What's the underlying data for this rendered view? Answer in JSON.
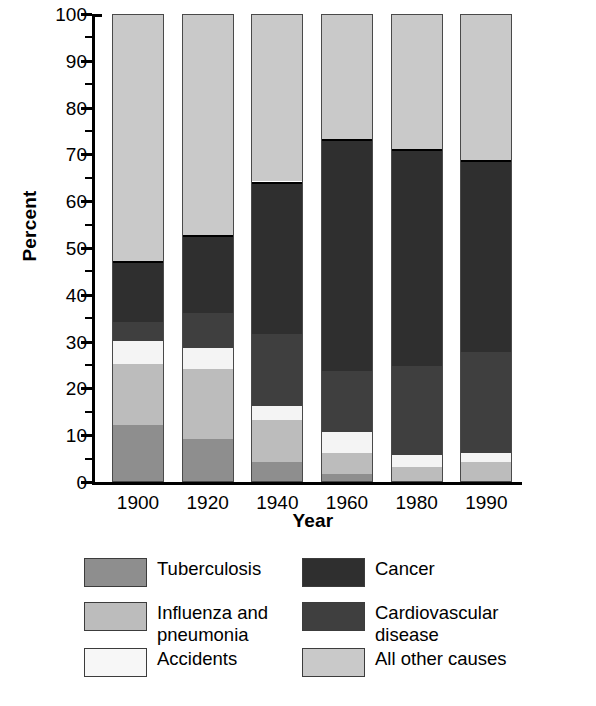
{
  "chart_data": {
    "type": "bar",
    "subtype": "stacked-bar-100-percent",
    "title": "",
    "xlabel": "Year",
    "ylabel": "Percent",
    "categories": [
      "1900",
      "1920",
      "1940",
      "1960",
      "1980",
      "1990"
    ],
    "ylim": [
      0,
      100
    ],
    "ytick_major": [
      0,
      10,
      20,
      30,
      40,
      50,
      60,
      70,
      80,
      90,
      100
    ],
    "ytick_minor": [
      5,
      15,
      25,
      35,
      45,
      55,
      65,
      75,
      85,
      95
    ],
    "ytick_labels": [
      "0",
      "10",
      "20",
      "30",
      "40",
      "50",
      "60",
      "70",
      "80",
      "90",
      "100"
    ],
    "grid": false,
    "legend_position": "below-plot",
    "series": [
      {
        "name": "Tuberculosis",
        "color": "#8e8e8e",
        "values": [
          12,
          9,
          4,
          1.5,
          0,
          0
        ]
      },
      {
        "name": "Influenza and pneumonia",
        "color": "#bcbcbc",
        "values": [
          13,
          15,
          9,
          4.5,
          3,
          4
        ]
      },
      {
        "name": "Accidents",
        "color": "#f4f4f4",
        "values": [
          5,
          4.5,
          3,
          4.5,
          2.5,
          2
        ]
      },
      {
        "name": "Cardiovascular disease",
        "color": "#3f3f3f",
        "values": [
          4,
          7.5,
          15.5,
          13,
          19,
          21.5
        ]
      },
      {
        "name": "Cancer",
        "color": "#2f2f2f",
        "values": [
          13,
          16.5,
          32.5,
          49.5,
          46.5,
          41
        ]
      },
      {
        "name": "All other causes",
        "color": "#c9c9c9",
        "values": [
          53,
          47.5,
          36,
          27,
          29,
          31.5
        ]
      }
    ],
    "stack_tops": {
      "1900": [
        12,
        25,
        30,
        34,
        47,
        100
      ],
      "1920": [
        9,
        24,
        28.5,
        36,
        52.5,
        100
      ],
      "1940": [
        4,
        13,
        16,
        31.5,
        64,
        100
      ],
      "1960": [
        1.5,
        6,
        10.5,
        23.5,
        73,
        100
      ],
      "1980": [
        0,
        3,
        5.5,
        24.5,
        71,
        100
      ],
      "1990": [
        0,
        4,
        6,
        27.5,
        68.5,
        100
      ]
    }
  },
  "legend": {
    "entries": [
      {
        "label": "Tuberculosis",
        "color": "#8e8e8e"
      },
      {
        "label": "Cancer",
        "color": "#2f2f2f"
      },
      {
        "label": "Influenza and pneumonia",
        "color": "#bcbcbc"
      },
      {
        "label": "Cardiovascular disease",
        "color": "#3f3f3f"
      },
      {
        "label": "Accidents",
        "color": "#f7f7f7"
      },
      {
        "label": "All other causes",
        "color": "#c9c9c9"
      }
    ]
  }
}
